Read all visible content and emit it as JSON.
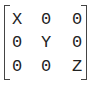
{
  "matrix": {
    "rows": [
      [
        "X",
        "0",
        "0"
      ],
      [
        "0",
        "Y",
        "0"
      ],
      [
        "0",
        "0",
        "Z"
      ]
    ]
  }
}
